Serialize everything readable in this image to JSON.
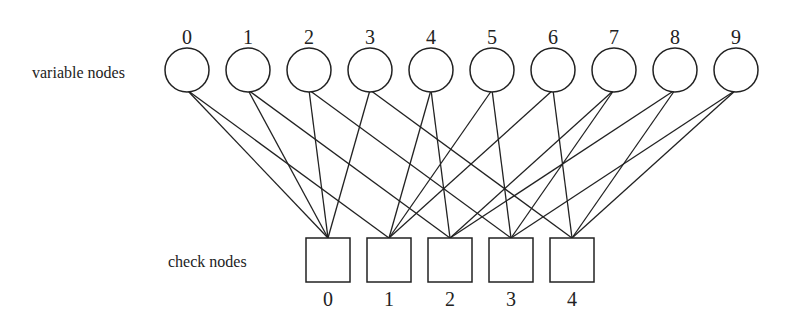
{
  "labels": {
    "variable_nodes": "variable nodes",
    "check_nodes": "check nodes"
  },
  "variable_nodes": [
    {
      "id": "0",
      "x": 187
    },
    {
      "id": "1",
      "x": 248
    },
    {
      "id": "2",
      "x": 309
    },
    {
      "id": "3",
      "x": 370
    },
    {
      "id": "4",
      "x": 431
    },
    {
      "id": "5",
      "x": 492
    },
    {
      "id": "6",
      "x": 553
    },
    {
      "id": "7",
      "x": 614
    },
    {
      "id": "8",
      "x": 675
    },
    {
      "id": "9",
      "x": 736
    }
  ],
  "check_nodes": [
    {
      "id": "0",
      "x": 328
    },
    {
      "id": "1",
      "x": 389
    },
    {
      "id": "2",
      "x": 450
    },
    {
      "id": "3",
      "x": 511
    },
    {
      "id": "4",
      "x": 572
    }
  ],
  "edges": [
    [
      0,
      0
    ],
    [
      0,
      1
    ],
    [
      1,
      0
    ],
    [
      1,
      2
    ],
    [
      2,
      0
    ],
    [
      2,
      3
    ],
    [
      3,
      0
    ],
    [
      3,
      4
    ],
    [
      4,
      1
    ],
    [
      4,
      2
    ],
    [
      5,
      1
    ],
    [
      5,
      3
    ],
    [
      6,
      1
    ],
    [
      6,
      4
    ],
    [
      7,
      2
    ],
    [
      7,
      3
    ],
    [
      8,
      2
    ],
    [
      8,
      4
    ],
    [
      9,
      3
    ],
    [
      9,
      4
    ]
  ],
  "style": {
    "stroke": "#222222",
    "background": "#ffffff"
  }
}
